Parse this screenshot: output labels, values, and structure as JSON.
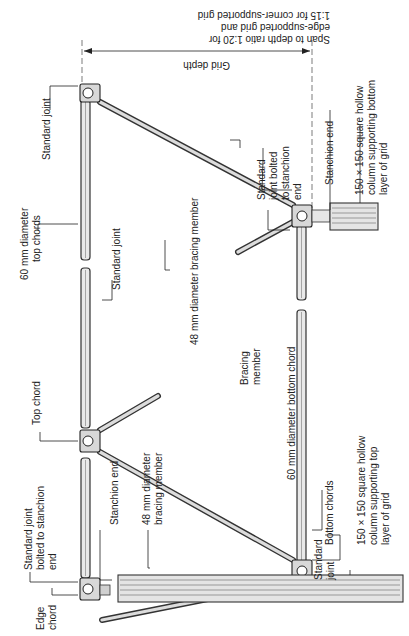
{
  "diagram": {
    "orientation": "rotated 90 degrees counter-clockwise (text reads bottom to top)",
    "colors": {
      "ink": "#222222",
      "member_fill": "#e9e9e9",
      "joint_fill": "#d8d8d8",
      "background": "#ffffff"
    },
    "labels": {
      "span_ratio_line1": "Span to depth ratio 1:20 for",
      "span_ratio_line2": "edge-supported grid and",
      "span_ratio_line3": "1:15 for corner-supported grid",
      "grid_depth": "Grid depth",
      "standard_joint_top_right": "Standard joint",
      "top_chords_line1": "60 mm diameter",
      "top_chords_line2": "top chords",
      "standard_joint_mid": "Standard joint",
      "top_chord": "Top chord",
      "standard_joint_bolted_left_line1": "Standard joint",
      "standard_joint_bolted_left_line2": "bolted to stanchion",
      "standard_joint_bolted_left_line3": "end",
      "edge_chord_line1": "Edge",
      "edge_chord_line2": "chord",
      "stanchion_end_left": "Stanchion end",
      "bracing_48_left_line1": "48 mm diameter",
      "bracing_48_left_line2": "bracing member",
      "bracing_member_line1": "Bracing",
      "bracing_member_line2": "member",
      "bottom_chord_60": "60 mm diameter bottom chord",
      "bracing_48_center": "48 mm diameter bracing member",
      "standard_joint_bottom_line1": "Standard",
      "standard_joint_bottom_line2": "joint",
      "bottom_chords": "Bottom chords",
      "column_top_line1": "150 × 150 square hollow",
      "column_top_line2": "column supporting top",
      "column_top_line3": "layer of grid",
      "standard_joint_bolted_right_line1": "Standard",
      "standard_joint_bolted_right_line2": "joint bolted",
      "standard_joint_bolted_right_line3": "to stanchion",
      "standard_joint_bolted_right_line4": "end",
      "stanchion_end_right": "Stanchion end",
      "column_bottom_line1": "150 × 150 square hollow",
      "column_bottom_line2": "column supporting bottom",
      "column_bottom_line3": "layer of grid"
    }
  }
}
